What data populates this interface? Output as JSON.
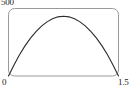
{
  "figure": {
    "name": "parabolic-arch-plot",
    "background_color": "#ffffff",
    "frame_color": "#9a9a9a",
    "curve_color": "#2b2b2b"
  },
  "labels": {
    "y_max": "500",
    "x_min": "0",
    "x_max": "1.5"
  },
  "chart_data": {
    "type": "line",
    "title": "",
    "xlabel": "",
    "ylabel": "",
    "grid": false,
    "legend": null,
    "xlim": [
      0,
      1.5
    ],
    "ylim": [
      0,
      500
    ],
    "xticks": [
      0,
      1.5
    ],
    "xticklabels": [
      "0",
      "1.5"
    ],
    "yticks": [
      500
    ],
    "yticklabels": [
      "500"
    ],
    "frame": {
      "visible": true,
      "rounded_corners": true,
      "color": "#9a9a9a"
    },
    "series": [
      {
        "name": "arch",
        "color": "#2b2b2b",
        "x": [
          0,
          0.075,
          0.15,
          0.225,
          0.3,
          0.375,
          0.45,
          0.525,
          0.6,
          0.675,
          0.75,
          0.825,
          0.9,
          0.975,
          1.05,
          1.125,
          1.2,
          1.275,
          1.35,
          1.425,
          1.5
        ],
        "y": [
          0,
          68,
          130,
          185,
          232,
          272,
          306,
          332,
          351,
          363,
          367,
          363,
          351,
          332,
          306,
          272,
          232,
          185,
          130,
          68,
          0
        ]
      }
    ]
  }
}
